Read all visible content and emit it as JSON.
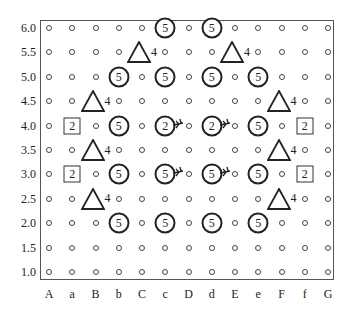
{
  "diagram": {
    "y_labels": [
      "6.0",
      "5.5",
      "5.0",
      "4.5",
      "4.0",
      "3.5",
      "3.0",
      "2.5",
      "2.0",
      "1.5",
      "1.0"
    ],
    "x_labels": [
      "A",
      "a",
      "B",
      "b",
      "C",
      "c",
      "D",
      "d",
      "E",
      "e",
      "F",
      "f",
      "G"
    ],
    "marker_legend": {
      "circle": "bold circle with number",
      "triangle": "triangle with number",
      "square": "square with number",
      "dot": "small open circle (grid point)"
    },
    "markers": [
      {
        "shape": "circle",
        "label": "5",
        "col": "c",
        "row": "6.0"
      },
      {
        "shape": "circle",
        "label": "5",
        "col": "d",
        "row": "6.0"
      },
      {
        "shape": "triangle",
        "label": "4",
        "col": "C",
        "row": "5.5"
      },
      {
        "shape": "triangle",
        "label": "4",
        "col": "E",
        "row": "5.5"
      },
      {
        "shape": "circle",
        "label": "5",
        "col": "b",
        "row": "5.0"
      },
      {
        "shape": "circle",
        "label": "5",
        "col": "c",
        "row": "5.0"
      },
      {
        "shape": "circle",
        "label": "5",
        "col": "d",
        "row": "5.0"
      },
      {
        "shape": "circle",
        "label": "5",
        "col": "e",
        "row": "5.0"
      },
      {
        "shape": "triangle",
        "label": "4",
        "col": "B",
        "row": "4.5"
      },
      {
        "shape": "triangle",
        "label": "4",
        "col": "F",
        "row": "4.5"
      },
      {
        "shape": "square",
        "label": "2",
        "col": "a",
        "row": "4.0"
      },
      {
        "shape": "circle",
        "label": "5",
        "col": "b",
        "row": "4.0"
      },
      {
        "shape": "circle",
        "label": "2",
        "col": "c",
        "row": "4.0",
        "arrow": "right"
      },
      {
        "shape": "circle",
        "label": "2",
        "col": "d",
        "row": "4.0",
        "arrow": "right"
      },
      {
        "shape": "circle",
        "label": "5",
        "col": "e",
        "row": "4.0"
      },
      {
        "shape": "square",
        "label": "2",
        "col": "f",
        "row": "4.0"
      },
      {
        "shape": "triangle",
        "label": "4",
        "col": "B",
        "row": "3.5"
      },
      {
        "shape": "triangle",
        "label": "4",
        "col": "F",
        "row": "3.5"
      },
      {
        "shape": "square",
        "label": "2",
        "col": "a",
        "row": "3.0"
      },
      {
        "shape": "circle",
        "label": "5",
        "col": "b",
        "row": "3.0"
      },
      {
        "shape": "circle",
        "label": "5",
        "col": "c",
        "row": "3.0",
        "arrow": "right"
      },
      {
        "shape": "circle",
        "label": "5",
        "col": "d",
        "row": "3.0",
        "arrow": "right"
      },
      {
        "shape": "circle",
        "label": "5",
        "col": "e",
        "row": "3.0"
      },
      {
        "shape": "square",
        "label": "2",
        "col": "f",
        "row": "3.0"
      },
      {
        "shape": "triangle",
        "label": "4",
        "col": "B",
        "row": "2.5"
      },
      {
        "shape": "triangle",
        "label": "4",
        "col": "F",
        "row": "2.5"
      },
      {
        "shape": "circle",
        "label": "5",
        "col": "b",
        "row": "2.0"
      },
      {
        "shape": "circle",
        "label": "5",
        "col": "c",
        "row": "2.0"
      },
      {
        "shape": "circle",
        "label": "5",
        "col": "d",
        "row": "2.0"
      },
      {
        "shape": "circle",
        "label": "5",
        "col": "e",
        "row": "2.0"
      }
    ]
  }
}
